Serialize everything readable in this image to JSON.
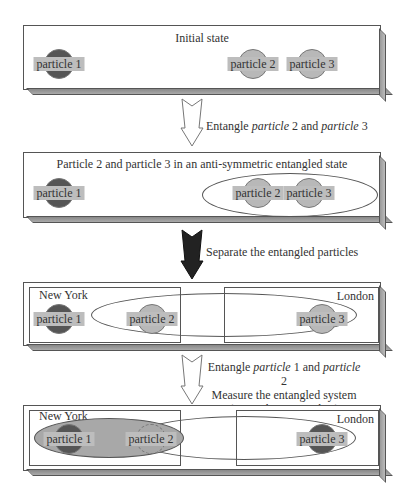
{
  "panels": [
    {
      "title": "Initial state",
      "particles": [
        "particle 1",
        "particle 2",
        "particle 3"
      ]
    },
    {
      "title": "Particle 2 and particle 3 in an anti-symmetric entangled state",
      "particles": [
        "particle 1",
        "particle 2",
        "particle 3"
      ]
    },
    {
      "title": "",
      "cities": [
        "New York",
        "London"
      ],
      "particles": [
        "particle 1",
        "particle 2",
        "particle 3"
      ]
    },
    {
      "title": "",
      "cities": [
        "New York",
        "London"
      ],
      "particles": [
        "particle 1",
        "particle 2",
        "particle 3"
      ]
    }
  ],
  "steps": [
    {
      "prefix": "Entangle ",
      "i1": "particle",
      "mid": " 2 and ",
      "i2": "particle",
      "suffix": " 3",
      "arrow": "hollow"
    },
    {
      "text": "Separate the entangled particles",
      "arrow": "solid"
    },
    {
      "line1_prefix": "Entangle ",
      "line1_i1": "particle",
      "line1_mid": " 1 and ",
      "line1_i2": "particle",
      "line1_suffix": " 2",
      "line2": "Measure the entangled system",
      "line3_open": "( ",
      "line3_i1": "particle",
      "line3_mid": " 1, ",
      "line3_i2": "particle",
      "line3_close": " 2)",
      "arrow": "hollow"
    }
  ],
  "colors": {
    "dark_particle": "#555555",
    "light_particle": "#b8b8b8",
    "label_bg": "#bdbdbd",
    "entangled_fill": "#a8a8a8"
  }
}
